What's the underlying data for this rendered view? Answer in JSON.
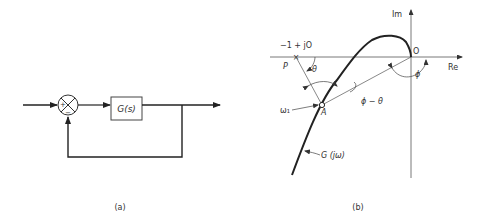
{
  "figure_a": {
    "caption": "(a)",
    "block_label": "G(s)",
    "sum_plus": "+",
    "sum_minus": "−"
  },
  "figure_b": {
    "caption": "(b)",
    "axis_im": "Im",
    "axis_re": "Re",
    "origin_label": "O",
    "point_p_label": "P",
    "point_p_value": "−1 + jO",
    "point_a_label": "A",
    "omega_label": "ω₁",
    "curve_label": "G (jω)",
    "angle_theta": "θ",
    "angle_phi": "ϕ",
    "angle_phi_minus_theta": "ϕ − θ"
  },
  "colors": {
    "ink": "#222222",
    "thin": "#555555"
  }
}
